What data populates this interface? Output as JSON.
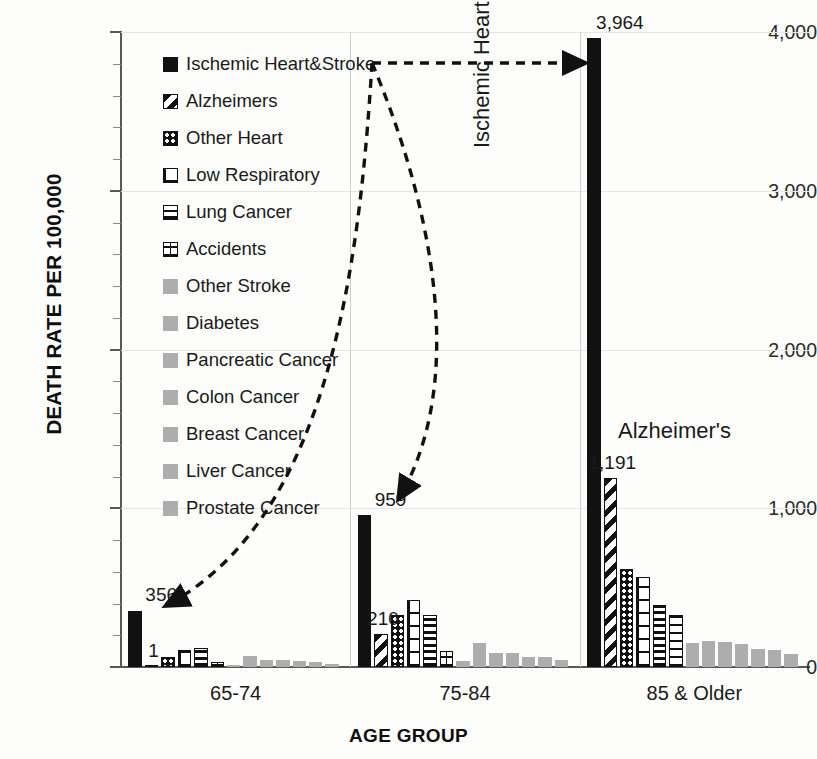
{
  "chart_data": {
    "type": "bar",
    "title": "",
    "xlabel": "AGE GROUP",
    "ylabel": "DEATH RATE PER 100,000",
    "ylim": [
      0,
      4000
    ],
    "yticks": [
      "0",
      "1,000",
      "2,000",
      "3,000",
      "4,000"
    ],
    "ytick_values": [
      0,
      1000,
      2000,
      3000,
      4000
    ],
    "minor_tick_step": 200,
    "grid": "horizontal",
    "legend_position": "inside-upper-left",
    "categories": [
      "65-74",
      "75-84",
      "85 & Older"
    ],
    "series": [
      {
        "name": "Ischemic Heart&Stroke",
        "pattern": "solid-black",
        "values": [
          356,
          959,
          3964
        ]
      },
      {
        "name": "Alzheimers",
        "pattern": "diagonal-stripe",
        "values": [
          1,
          210,
          1191
        ]
      },
      {
        "name": "Other Heart",
        "pattern": "dots",
        "values": [
          60,
          330,
          620
        ]
      },
      {
        "name": "Low Respiratory",
        "pattern": "grid",
        "values": [
          105,
          420,
          565
        ]
      },
      {
        "name": "Lung Cancer",
        "pattern": "horizontal-lines",
        "values": [
          122,
          330,
          390
        ]
      },
      {
        "name": "Accidents",
        "pattern": "vertical-dash",
        "values": [
          30,
          100,
          330
        ]
      },
      {
        "name": "Other Stroke",
        "pattern": "gray",
        "values": [
          10,
          35,
          150
        ]
      },
      {
        "name": "Diabetes",
        "pattern": "gray",
        "values": [
          70,
          150,
          165
        ]
      },
      {
        "name": "Pancreatic Cancer",
        "pattern": "gray",
        "values": [
          45,
          90,
          160
        ]
      },
      {
        "name": "Colon Cancer",
        "pattern": "gray",
        "values": [
          45,
          90,
          145
        ]
      },
      {
        "name": "Breast Cancer",
        "pattern": "gray",
        "values": [
          35,
          65,
          115
        ]
      },
      {
        "name": "Liver Cancer",
        "pattern": "gray",
        "values": [
          33,
          60,
          110
        ]
      },
      {
        "name": "Prostate Cancer",
        "pattern": "gray",
        "values": [
          22,
          42,
          85
        ]
      }
    ],
    "data_labels": [
      {
        "text": "356",
        "category": "65-74",
        "series": "Ischemic Heart&Stroke"
      },
      {
        "text": "1",
        "category": "65-74",
        "series": "Alzheimers"
      },
      {
        "text": "959",
        "category": "75-84",
        "series": "Ischemic Heart&Stroke"
      },
      {
        "text": "210",
        "category": "75-84",
        "series": "Alzheimers"
      },
      {
        "text": "3,964",
        "category": "85 & Older",
        "series": "Ischemic Heart&Stroke"
      },
      {
        "text": "1,191",
        "category": "85 & Older",
        "series": "Alzheimers"
      }
    ],
    "annotations": [
      {
        "text": "Ischemic Heart & Stroke",
        "orientation": "vertical"
      },
      {
        "text": "Alzheimer's",
        "orientation": "horizontal"
      }
    ],
    "colors": {
      "primary": "#111111",
      "gray_series": "#adadad",
      "gridline": "#e6e6e6",
      "axis": "#585858",
      "background": "#fdfdfc"
    }
  },
  "legend": {
    "items": [
      {
        "label": "Ischemic Heart&Stroke"
      },
      {
        "label": "Alzheimers"
      },
      {
        "label": "Other Heart"
      },
      {
        "label": "Low Respiratory"
      },
      {
        "label": "Lung Cancer"
      },
      {
        "label": "Accidents"
      },
      {
        "label": "Other Stroke"
      },
      {
        "label": "Diabetes"
      },
      {
        "label": "Pancreatic Cancer"
      },
      {
        "label": "Colon Cancer"
      },
      {
        "label": "Breast Cancer"
      },
      {
        "label": "Liver Cancer"
      },
      {
        "label": "Prostate Cancer"
      }
    ]
  }
}
